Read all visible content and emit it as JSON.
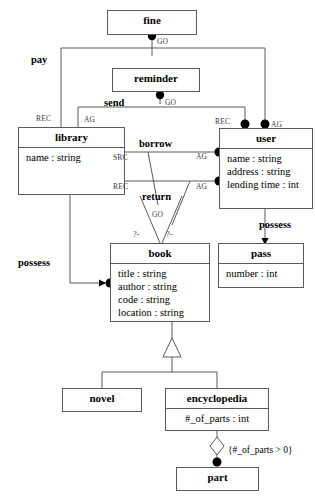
{
  "diagram": {
    "type": "uml-class-diagram",
    "classes": [
      {
        "id": "fine",
        "name": "fine",
        "attributes": []
      },
      {
        "id": "reminder",
        "name": "reminder",
        "attributes": []
      },
      {
        "id": "library",
        "name": "library",
        "attributes": [
          "name : string"
        ]
      },
      {
        "id": "user",
        "name": "user",
        "attributes": [
          "name : string",
          "address : string",
          "lending time : int"
        ]
      },
      {
        "id": "pass",
        "name": "pass",
        "attributes": [
          "number : int"
        ]
      },
      {
        "id": "book",
        "name": "book",
        "attributes": [
          "title : string",
          "author : string",
          "code : string",
          "location : string"
        ]
      },
      {
        "id": "novel",
        "name": "novel",
        "attributes": []
      },
      {
        "id": "encyclopedia",
        "name": "encyclopedia",
        "attributes": [
          "#_of_parts : int"
        ]
      },
      {
        "id": "part",
        "name": "part",
        "attributes": []
      }
    ],
    "associations": [
      {
        "id": "pay",
        "label": "pay"
      },
      {
        "id": "send",
        "label": "send"
      },
      {
        "id": "borrow",
        "label": "borrow"
      },
      {
        "id": "return",
        "label": "return"
      },
      {
        "id": "possess_left",
        "label": "possess"
      },
      {
        "id": "possess_right",
        "label": "possess"
      }
    ],
    "roles": {
      "fine_go": "GO",
      "pay_rec": "REC",
      "pay_ag": "AG",
      "reminder_go": "GO",
      "send_ag": "AG",
      "send_rec": "REC",
      "borrow_src": "SRC",
      "borrow_ag": "AG",
      "return_rec": "REC",
      "return_ag": "AG",
      "return_go": "GO"
    },
    "multiplicities": {
      "return_left": "?-",
      "return_right": "?-"
    },
    "constraint": "{#_of_parts > 0}",
    "colors": {
      "stroke": "#5a5a5a",
      "text": "#000000",
      "role_text": "#3b3b3b",
      "background": "#ffffff",
      "dot_fill": "#000000"
    }
  }
}
